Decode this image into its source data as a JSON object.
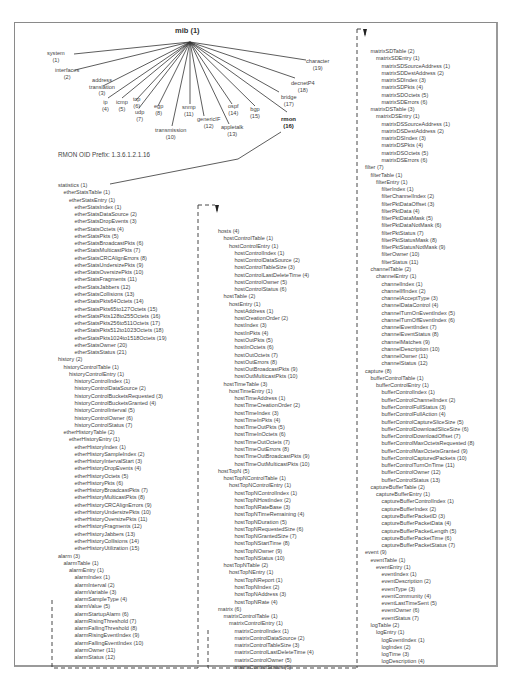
{
  "diagram": {
    "root": {
      "name": "mib",
      "id": "(1)"
    },
    "children": [
      {
        "name": "system",
        "id": "(1)"
      },
      {
        "name": "interfaces",
        "id": "(2)"
      },
      {
        "name": "address translation",
        "id": "(3)"
      },
      {
        "name": "ip",
        "id": "(4)"
      },
      {
        "name": "icmp",
        "id": "(5)"
      },
      {
        "name": "tcp",
        "id": "(6)"
      },
      {
        "name": "udp",
        "id": "(7)"
      },
      {
        "name": "egp",
        "id": "(8)"
      },
      {
        "name": "transmission",
        "id": "(10)"
      },
      {
        "name": "snmp",
        "id": "(11)"
      },
      {
        "name": "genericIF",
        "id": "(12)"
      },
      {
        "name": "appletalk",
        "id": "(13)"
      },
      {
        "name": "ospf",
        "id": "(14)"
      },
      {
        "name": "bgp",
        "id": "(15)"
      },
      {
        "name": "rmon",
        "id": "(16)"
      },
      {
        "name": "bridge",
        "id": "(17)"
      },
      {
        "name": "decnetP4",
        "id": "(18)"
      },
      {
        "name": "character",
        "id": "(19)"
      }
    ],
    "prefix": "RMON OID Prefix: 1.3.6.1.2.1.16"
  },
  "tree": {
    "col1": [
      {
        "t": "statistics (1)",
        "d": 0
      },
      {
        "t": "etherStatsTable (1)",
        "d": 1
      },
      {
        "t": "etherStatsEntry (1)",
        "d": 2
      },
      {
        "t": "etherStatsIndex (1)",
        "d": 3
      },
      {
        "t": "etherStatsDataSource (2)",
        "d": 3
      },
      {
        "t": "etherStatsDropEvents (3)",
        "d": 3
      },
      {
        "t": "etherStatsOctets (4)",
        "d": 3
      },
      {
        "t": "etherStatsPkts (5)",
        "d": 3
      },
      {
        "t": "etherStatsBroadcastPkts (6)",
        "d": 3
      },
      {
        "t": "etherStatsMulticastPkts (7)",
        "d": 3
      },
      {
        "t": "etherStatsCRCAlignErrors (8)",
        "d": 3
      },
      {
        "t": "etherStatsUndersizePkts (9)",
        "d": 3
      },
      {
        "t": "etherStatsOversizePkts (10)",
        "d": 3
      },
      {
        "t": "etherStatsFragments (11)",
        "d": 3
      },
      {
        "t": "etherStatsJabbers (12)",
        "d": 3
      },
      {
        "t": "etherStatsCollisions (13)",
        "d": 3
      },
      {
        "t": "etherStatsPkts64Octets (14)",
        "d": 3
      },
      {
        "t": "etherStatsPkts65to127Octets (15)",
        "d": 3
      },
      {
        "t": "etherStatsPkts128to255Octets (16)",
        "d": 3
      },
      {
        "t": "etherStatsPkts256to511Octets (17)",
        "d": 3
      },
      {
        "t": "etherStatsPkts512to1023Octets (18)",
        "d": 3
      },
      {
        "t": "etherStatsPkts1024to1518Octets (19)",
        "d": 3
      },
      {
        "t": "etherStatsOwner (20)",
        "d": 3
      },
      {
        "t": "etherStatsStatus (21)",
        "d": 3
      },
      {
        "t": "history (2)",
        "d": 0
      },
      {
        "t": "historyControlTable (1)",
        "d": 1
      },
      {
        "t": "historyControlEntry (1)",
        "d": 2
      },
      {
        "t": "historyControlIndex (1)",
        "d": 3
      },
      {
        "t": "historyControlDataSource (2)",
        "d": 3
      },
      {
        "t": "historyControlBucketsRequested (3)",
        "d": 3
      },
      {
        "t": "historyControlBucketsGranted (4)",
        "d": 3
      },
      {
        "t": "historyControlInterval (5)",
        "d": 3
      },
      {
        "t": "historyControlOwner (6)",
        "d": 3
      },
      {
        "t": "historyControlStatus (7)",
        "d": 3
      },
      {
        "t": "etherHistoryTable (2)",
        "d": 1
      },
      {
        "t": "etherHistoryEntry (1)",
        "d": 2
      },
      {
        "t": "etherHistoryIndex (1)",
        "d": 3
      },
      {
        "t": "etherHistorySampleIndex (2)",
        "d": 3
      },
      {
        "t": "etherHistoryIntervalStart (3)",
        "d": 3
      },
      {
        "t": "etherHistoryDropEvents (4)",
        "d": 3
      },
      {
        "t": "etherHistoryOctets (5)",
        "d": 3
      },
      {
        "t": "etherHistoryPkts (6)",
        "d": 3
      },
      {
        "t": "etherHistoryBroadcastPkts (7)",
        "d": 3
      },
      {
        "t": "etherHistoryMulticastPkts (8)",
        "d": 3
      },
      {
        "t": "etherHistoryCRCAlignErrors (9)",
        "d": 3
      },
      {
        "t": "etherHistoryUndersizePkts (10)",
        "d": 3
      },
      {
        "t": "etherHistoryOversizePkts (11)",
        "d": 3
      },
      {
        "t": "etherHistoryFragments (12)",
        "d": 3
      },
      {
        "t": "etherHistoryJabbers (13)",
        "d": 3
      },
      {
        "t": "etherHistoryCollisions (14)",
        "d": 3
      },
      {
        "t": "etherHistoryUtilization (15)",
        "d": 3
      },
      {
        "t": "alarm (3)",
        "d": 0
      },
      {
        "t": "alarmTable (1)",
        "d": 1
      },
      {
        "t": "alarmEntry (1)",
        "d": 2
      },
      {
        "t": "alarmIndex (1)",
        "d": 3
      },
      {
        "t": "alarmInterval (2)",
        "d": 3
      },
      {
        "t": "alarmVariable (3)",
        "d": 3
      },
      {
        "t": "alarmSampleType (4)",
        "d": 3
      },
      {
        "t": "alarmValue (5)",
        "d": 3
      },
      {
        "t": "alarmStartupAlarm (6)",
        "d": 3
      },
      {
        "t": "alarmRisingThreshold (7)",
        "d": 3
      },
      {
        "t": "alarmFallingThreshold (8)",
        "d": 3
      },
      {
        "t": "alarmRisingEventIndex (9)",
        "d": 3
      },
      {
        "t": "alarmFallingEventIndex (10)",
        "d": 3
      },
      {
        "t": "alarmOwner (11)",
        "d": 3
      },
      {
        "t": "alarmStatus (12)",
        "d": 3
      }
    ],
    "col2": [
      {
        "t": "hosts (4)",
        "d": 0
      },
      {
        "t": "hostControlTable (1)",
        "d": 1
      },
      {
        "t": "hostControlEntry (1)",
        "d": 2
      },
      {
        "t": "hostControlIndex (1)",
        "d": 3
      },
      {
        "t": "hostControlDataSource (2)",
        "d": 3
      },
      {
        "t": "hostControlTableSize (3)",
        "d": 3
      },
      {
        "t": "hostControlLastDeleteTime (4)",
        "d": 3
      },
      {
        "t": "hostControlOwner (5)",
        "d": 3
      },
      {
        "t": "hostControlStatus (6)",
        "d": 3
      },
      {
        "t": "hostTable (2)",
        "d": 1
      },
      {
        "t": "hostEntry (1)",
        "d": 2
      },
      {
        "t": "hostAddress (1)",
        "d": 3
      },
      {
        "t": "hostCreationOrder (2)",
        "d": 3
      },
      {
        "t": "hostIndex (3)",
        "d": 3
      },
      {
        "t": "hostInPkts (4)",
        "d": 3
      },
      {
        "t": "hostOutPkts (5)",
        "d": 3
      },
      {
        "t": "hostInOctets (6)",
        "d": 3
      },
      {
        "t": "hostOutOctets (7)",
        "d": 3
      },
      {
        "t": "hostOutErrors (8)",
        "d": 3
      },
      {
        "t": "hostOutBroadcastPkts (9)",
        "d": 3
      },
      {
        "t": "hostOutMulticastPkts (10)",
        "d": 3
      },
      {
        "t": "hostTimeTable (3)",
        "d": 1
      },
      {
        "t": "hostTimeEntry (1)",
        "d": 2
      },
      {
        "t": "hostTimeAddress (1)",
        "d": 3
      },
      {
        "t": "hostTimeCreationOrder (2)",
        "d": 3
      },
      {
        "t": "hostTimeIndex (3)",
        "d": 3
      },
      {
        "t": "hostTimeInPkts (4)",
        "d": 3
      },
      {
        "t": "hostTimeOutPkts (5)",
        "d": 3
      },
      {
        "t": "hostTimeInOctets (6)",
        "d": 3
      },
      {
        "t": "hostTimeOutOctets (7)",
        "d": 3
      },
      {
        "t": "hostTimeOutErrors (8)",
        "d": 3
      },
      {
        "t": "hostTimeOutBroadcastPkts (9)",
        "d": 3
      },
      {
        "t": "hostTimeOutMulticastPkts (10)",
        "d": 3
      },
      {
        "t": "hostTopN (5)",
        "d": 0
      },
      {
        "t": "hostTopNControlTable (1)",
        "d": 1
      },
      {
        "t": "hostTopNControlEntry (1)",
        "d": 2
      },
      {
        "t": "hostTopNControlIndex (1)",
        "d": 3
      },
      {
        "t": "hostTopNHostIndex (2)",
        "d": 3
      },
      {
        "t": "hostTopNRateBase (3)",
        "d": 3
      },
      {
        "t": "hostTopNTimeRemaining (4)",
        "d": 3
      },
      {
        "t": "hostTopNDuration (5)",
        "d": 3
      },
      {
        "t": "hostTopNRequestedSize (6)",
        "d": 3
      },
      {
        "t": "hostTopNGrantedSize (7)",
        "d": 3
      },
      {
        "t": "hostTopNStartTime (8)",
        "d": 3
      },
      {
        "t": "hostTopNOwner (9)",
        "d": 3
      },
      {
        "t": "hostTopNStatus (10)",
        "d": 3
      },
      {
        "t": "hostTopNTable (2)",
        "d": 1
      },
      {
        "t": "hostTopNEntry (1)",
        "d": 2
      },
      {
        "t": "hostTopNReport (1)",
        "d": 3
      },
      {
        "t": "hostTopNIndex (2)",
        "d": 3
      },
      {
        "t": "hostTopNAddress (3)",
        "d": 3
      },
      {
        "t": "hostTopNRate (4)",
        "d": 3
      },
      {
        "t": "matrix (6)",
        "d": 0
      },
      {
        "t": "matrixControlTable (1)",
        "d": 1
      },
      {
        "t": "matrixControlEntry (1)",
        "d": 2
      },
      {
        "t": "matrixControlIndex (1)",
        "d": 3
      },
      {
        "t": "matrixControlDataSource (2)",
        "d": 3
      },
      {
        "t": "matrixControlTableSize (3)",
        "d": 3
      },
      {
        "t": "matrixControlLastDeleteTime (4)",
        "d": 3
      },
      {
        "t": "matrixControlOwner (5)",
        "d": 3
      },
      {
        "t": "matrixControlStatus (6)",
        "d": 3
      }
    ],
    "col3": [
      {
        "t": "matrixSDTable (2)",
        "d": 1
      },
      {
        "t": "matrixSDEntry (1)",
        "d": 2
      },
      {
        "t": "matrixSDSourceAddress (1)",
        "d": 3
      },
      {
        "t": "matrixSDDestAddress (2)",
        "d": 3
      },
      {
        "t": "matrixSDIndex (3)",
        "d": 3
      },
      {
        "t": "matrixSDPkts (4)",
        "d": 3
      },
      {
        "t": "matrixSDOctets (5)",
        "d": 3
      },
      {
        "t": "matrixSDErrors (6)",
        "d": 3
      },
      {
        "t": "matrixDSTable (3)",
        "d": 1
      },
      {
        "t": "matrixDSEntry (1)",
        "d": 2
      },
      {
        "t": "matrixDSSourceAddress (1)",
        "d": 3
      },
      {
        "t": "matrixDSDestAddress (2)",
        "d": 3
      },
      {
        "t": "matrixDSIndex (3)",
        "d": 3
      },
      {
        "t": "matrixDSPkts (4)",
        "d": 3
      },
      {
        "t": "matrixDSOctets (5)",
        "d": 3
      },
      {
        "t": "matrixDSErrors (6)",
        "d": 3
      },
      {
        "t": "filter (7)",
        "d": 0
      },
      {
        "t": "filterTable (1)",
        "d": 1
      },
      {
        "t": "filterEntry (1)",
        "d": 2
      },
      {
        "t": "filterIndex (1)",
        "d": 3
      },
      {
        "t": "filterChannelIndex (2)",
        "d": 3
      },
      {
        "t": "filterPktDataOffset (3)",
        "d": 3
      },
      {
        "t": "filterPktData (4)",
        "d": 3
      },
      {
        "t": "filterPktDataMask (5)",
        "d": 3
      },
      {
        "t": "filterPktDataNotMask (6)",
        "d": 3
      },
      {
        "t": "filterPktStatus (7)",
        "d": 3
      },
      {
        "t": "filterPktStatusMask (8)",
        "d": 3
      },
      {
        "t": "filterPktStatusNotMask (9)",
        "d": 3
      },
      {
        "t": "filterOwner (10)",
        "d": 3
      },
      {
        "t": "filterStatus (11)",
        "d": 3
      },
      {
        "t": "channelTable (2)",
        "d": 1
      },
      {
        "t": "channelEntry (1)",
        "d": 2
      },
      {
        "t": "channelIndex (1)",
        "d": 3
      },
      {
        "t": "channelIfIndex (2)",
        "d": 3
      },
      {
        "t": "channelAcceptType (3)",
        "d": 3
      },
      {
        "t": "channelDataControl (4)",
        "d": 3
      },
      {
        "t": "channelTurnOnEventIndex (5)",
        "d": 3
      },
      {
        "t": "channelTurnOffEventIndex (6)",
        "d": 3
      },
      {
        "t": "channelEventIndex (7)",
        "d": 3
      },
      {
        "t": "channelEventStatus (8)",
        "d": 3
      },
      {
        "t": "channelMatches (9)",
        "d": 3
      },
      {
        "t": "channelDescription (10)",
        "d": 3
      },
      {
        "t": "channelOwner (11)",
        "d": 3
      },
      {
        "t": "channelStatus (12)",
        "d": 3
      },
      {
        "t": "capture (8)",
        "d": 0
      },
      {
        "t": "bufferControlTable (1)",
        "d": 1
      },
      {
        "t": "bufferControlEntry (1)",
        "d": 2
      },
      {
        "t": "bufferControlIndex (1)",
        "d": 3
      },
      {
        "t": "bufferControlChannelIndex (2)",
        "d": 3
      },
      {
        "t": "bufferControlFullStatus (3)",
        "d": 3
      },
      {
        "t": "bufferControlFullAction (4)",
        "d": 3
      },
      {
        "t": "bufferControlCaptureSliceSize (5)",
        "d": 3
      },
      {
        "t": "bufferControlDownloadSliceSize (6)",
        "d": 3
      },
      {
        "t": "bufferControlDownloadOffset (7)",
        "d": 3
      },
      {
        "t": "bufferControlMaxOctetsRequested (8)",
        "d": 3
      },
      {
        "t": "bufferControlMaxOctetsGranted (9)",
        "d": 3
      },
      {
        "t": "bufferControlCapturedPackets (10)",
        "d": 3
      },
      {
        "t": "bufferControlTurnOnTime (11)",
        "d": 3
      },
      {
        "t": "bufferControlOwner (12)",
        "d": 3
      },
      {
        "t": "bufferControlStatus (13)",
        "d": 3
      },
      {
        "t": "captureBufferTable (2)",
        "d": 1
      },
      {
        "t": "captureBufferEntry (1)",
        "d": 2
      },
      {
        "t": "captureBufferControlIndex (1)",
        "d": 3
      },
      {
        "t": "captureBufferIndex (2)",
        "d": 3
      },
      {
        "t": "captureBufferPacketID (3)",
        "d": 3
      },
      {
        "t": "captureBufferPacketData (4)",
        "d": 3
      },
      {
        "t": "captureBufferPacketLength (5)",
        "d": 3
      },
      {
        "t": "captureBufferPacketTime (6)",
        "d": 3
      },
      {
        "t": "captureBufferPacketStatus (7)",
        "d": 3
      },
      {
        "t": "event (9)",
        "d": 0
      },
      {
        "t": "eventTable (1)",
        "d": 1
      },
      {
        "t": "eventEntry (1)",
        "d": 2
      },
      {
        "t": "eventIndex (1)",
        "d": 3
      },
      {
        "t": "eventDescription (2)",
        "d": 3
      },
      {
        "t": "eventType (3)",
        "d": 3
      },
      {
        "t": "eventCommunity (4)",
        "d": 3
      },
      {
        "t": "eventLastTimeSent (5)",
        "d": 3
      },
      {
        "t": "eventOwner (6)",
        "d": 3
      },
      {
        "t": "eventStatus (7)",
        "d": 3
      },
      {
        "t": "logTable (2)",
        "d": 1
      },
      {
        "t": "logEntry (1)",
        "d": 2
      },
      {
        "t": "logEventIndex (1)",
        "d": 3
      },
      {
        "t": "logIndex (2)",
        "d": 3
      },
      {
        "t": "logTime (3)",
        "d": 3
      },
      {
        "t": "logDescription (4)",
        "d": 3
      }
    ]
  }
}
